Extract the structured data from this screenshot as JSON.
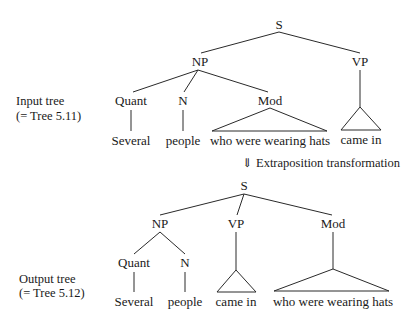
{
  "input_tree": {
    "caption_line1": "Input tree",
    "caption_line2": "(= Tree 5.11)",
    "nodes": {
      "root": "S",
      "np": "NP",
      "vp": "VP",
      "quant": "Quant",
      "n": "N",
      "mod": "Mod"
    },
    "leaves": {
      "quant": "Several",
      "n": "people",
      "mod": "who were wearing hats",
      "vp": "came in"
    }
  },
  "transformation": {
    "arrow": "⇓",
    "label": "Extraposition transformation"
  },
  "output_tree": {
    "caption_line1": "Output tree",
    "caption_line2": "(= Tree 5.12)",
    "nodes": {
      "root": "S",
      "np": "NP",
      "vp": "VP",
      "mod": "Mod",
      "quant": "Quant",
      "n": "N"
    },
    "leaves": {
      "quant": "Several",
      "n": "people",
      "vp": "came in",
      "mod": "who were wearing hats"
    }
  }
}
